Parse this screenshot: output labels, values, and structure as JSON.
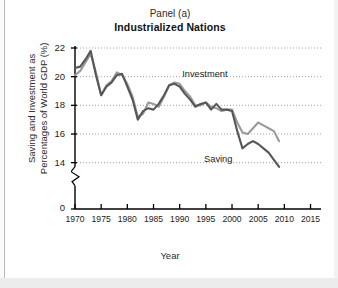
{
  "figure": {
    "panel_label": "Panel (a)",
    "panel_title": "Industrialized Nations",
    "xlabel": "Year",
    "ylabel": "Saving and Investment as\nPercentages of World GDP (%)"
  },
  "annotations": {
    "investment_label": "Investment",
    "saving_label": "Saving"
  },
  "colors": {
    "investment_line": "#9a9a9a",
    "saving_line": "#575757",
    "axis": "#000000",
    "gridline": "#8c8c8c",
    "background": "#ffffff",
    "page_background": "#f2f2f2"
  },
  "axes": {
    "y_ticks": [
      "22",
      "20",
      "18",
      "16",
      "14",
      "0"
    ],
    "y_axis_break": true,
    "x_ticks": [
      "1970",
      "1975",
      "1980",
      "1985",
      "1990",
      "1995",
      "2000",
      "2005",
      "2010",
      "2015"
    ],
    "grid": "horizontal-dotted",
    "legend": "inline-annotations"
  },
  "chart_data": {
    "type": "line",
    "title": "Industrialized Nations",
    "subtitle": "Panel (a)",
    "xlabel": "Year",
    "ylabel": "Saving and Investment as Percentages of World GDP (%)",
    "xlim": [
      1970,
      2017
    ],
    "ylim": [
      13.0,
      22.2
    ],
    "ytick_values": [
      22,
      20,
      18,
      16,
      14,
      0
    ],
    "xtick_values": [
      1970,
      1975,
      1980,
      1985,
      1990,
      1995,
      2000,
      2005,
      2010,
      2015
    ],
    "grid": true,
    "legend_position": "inline",
    "x": [
      1970,
      1971,
      1972,
      1973,
      1974,
      1975,
      1976,
      1977,
      1978,
      1979,
      1980,
      1981,
      1982,
      1983,
      1984,
      1985,
      1986,
      1987,
      1988,
      1989,
      1990,
      1991,
      1992,
      1993,
      1994,
      1995,
      1996,
      1997,
      1998,
      1999,
      2000,
      2001,
      2002,
      2003,
      2004,
      2005,
      2006,
      2007,
      2008,
      2009
    ],
    "series": [
      {
        "name": "Investment",
        "color": "#9a9a9a",
        "values": [
          20.1,
          20.4,
          21.0,
          21.6,
          20.3,
          18.7,
          19.4,
          19.7,
          20.3,
          20.1,
          19.5,
          18.6,
          17.2,
          17.4,
          18.2,
          18.1,
          17.9,
          18.6,
          19.4,
          19.6,
          19.5,
          19.0,
          18.6,
          18.0,
          18.0,
          18.2,
          17.9,
          17.8,
          17.6,
          17.7,
          17.7,
          16.8,
          16.1,
          16.0,
          16.4,
          16.8,
          16.6,
          16.4,
          16.2,
          15.5
        ]
      },
      {
        "name": "Saving",
        "color": "#575757",
        "values": [
          20.6,
          20.7,
          21.2,
          21.8,
          20.1,
          18.7,
          19.3,
          19.6,
          20.1,
          20.2,
          19.3,
          18.4,
          17.0,
          17.6,
          17.8,
          17.7,
          18.1,
          18.7,
          19.4,
          19.5,
          19.3,
          18.8,
          18.4,
          17.9,
          18.1,
          18.2,
          17.7,
          18.1,
          17.7,
          17.7,
          17.6,
          16.2,
          15.0,
          15.3,
          15.5,
          15.3,
          15.0,
          14.7,
          14.2,
          13.7
        ]
      }
    ],
    "annotations": [
      {
        "text": "Investment",
        "x": 1992,
        "y": 19.4
      },
      {
        "text": "Saving",
        "x": 2000,
        "y": 15.0
      }
    ]
  }
}
